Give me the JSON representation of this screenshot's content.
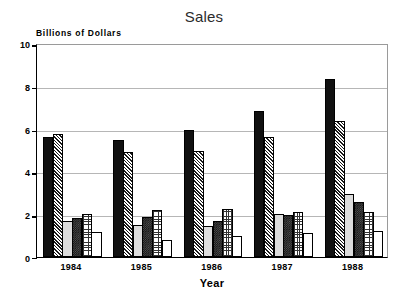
{
  "chart_data": {
    "type": "bar",
    "title": "Sales",
    "xlabel": "Year",
    "ylabel": "Billions of Dollars",
    "categories": [
      "1984",
      "1985",
      "1986",
      "1987",
      "1988"
    ],
    "ylim": [
      0,
      10
    ],
    "yticks": [
      "0",
      "2",
      "4",
      "6",
      "8",
      "10"
    ],
    "grid": true,
    "legend": "none",
    "series": [
      {
        "name": "Series 1",
        "pattern": "solid-black",
        "values": [
          5.6,
          5.45,
          5.95,
          6.8,
          8.3
        ]
      },
      {
        "name": "Series 2",
        "pattern": "diagonal-hatch",
        "values": [
          5.75,
          4.9,
          4.95,
          5.6,
          6.35
        ]
      },
      {
        "name": "Series 3",
        "pattern": "light-stipple",
        "values": [
          1.7,
          1.5,
          1.45,
          2.0,
          2.95
        ]
      },
      {
        "name": "Series 4",
        "pattern": "dark-stipple",
        "values": [
          1.8,
          1.85,
          1.7,
          1.95,
          2.55
        ]
      },
      {
        "name": "Series 5",
        "pattern": "cross-hatch",
        "values": [
          2.0,
          2.2,
          2.25,
          2.1,
          2.1
        ]
      },
      {
        "name": "Series 6",
        "pattern": "white-empty",
        "values": [
          1.15,
          0.8,
          1.0,
          1.1,
          1.2
        ]
      }
    ]
  },
  "colors": {
    "axis": "#000000",
    "grid": "#b6b6b6",
    "background": "#ffffff",
    "title": "#2b2b2b"
  }
}
